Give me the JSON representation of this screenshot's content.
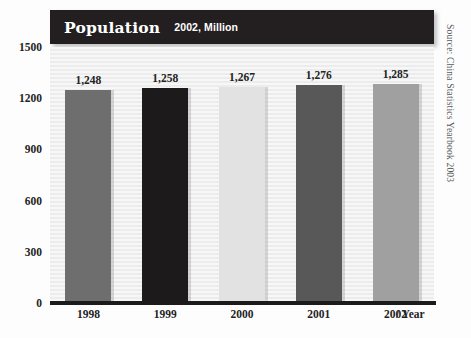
{
  "chart_data": {
    "type": "bar",
    "title": "Population",
    "subtitle": "2002, Million",
    "categories": [
      "1998",
      "1999",
      "2000",
      "2001",
      "2002"
    ],
    "values": [
      1248,
      1258,
      1267,
      1276,
      1285
    ],
    "value_labels": [
      "1,248",
      "1,258",
      "1,267",
      "1,276",
      "1,285"
    ],
    "xlabel": "/ Year",
    "ylabel": "",
    "ylim": [
      0,
      1500
    ],
    "yticks": [
      1500,
      1200,
      900,
      600,
      300,
      0
    ],
    "ytick_labels": [
      "1500",
      "1200",
      "900",
      "600",
      "300",
      "0"
    ],
    "grid": false,
    "legend": "none",
    "bar_colors": [
      "#6e6e6e",
      "#1c1a1a",
      "#e2e2e2",
      "#585858",
      "#a0a0a0"
    ],
    "source": "Source: China Statistics Yearbook 2003"
  },
  "colors": {
    "title_bar_bg": "#231f20",
    "title_text": "#ffffff",
    "axis_line": "#1c1a1a",
    "plot_bg": "#f2f2f2",
    "tick_text": "#232323",
    "source_text": "#5a5a5a"
  }
}
